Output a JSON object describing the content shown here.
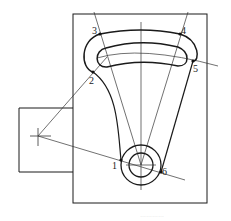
{
  "diagram": {
    "type": "mechanical-linkage-drawing",
    "points": [
      {
        "id": "1",
        "label": "1",
        "x": 121,
        "y": 160
      },
      {
        "id": "2",
        "label": "2",
        "x": 93,
        "y": 72
      },
      {
        "id": "3",
        "label": "3",
        "x": 100,
        "y": 34
      },
      {
        "id": "4",
        "label": "4",
        "x": 180,
        "y": 34
      },
      {
        "id": "5",
        "label": "5",
        "x": 193,
        "y": 61
      },
      {
        "id": "6",
        "label": "6",
        "x": 161,
        "y": 172
      }
    ],
    "caption": "…………"
  },
  "colors": {
    "line": "#1a1a1a",
    "thin": "#333333",
    "background": "#ffffff"
  }
}
